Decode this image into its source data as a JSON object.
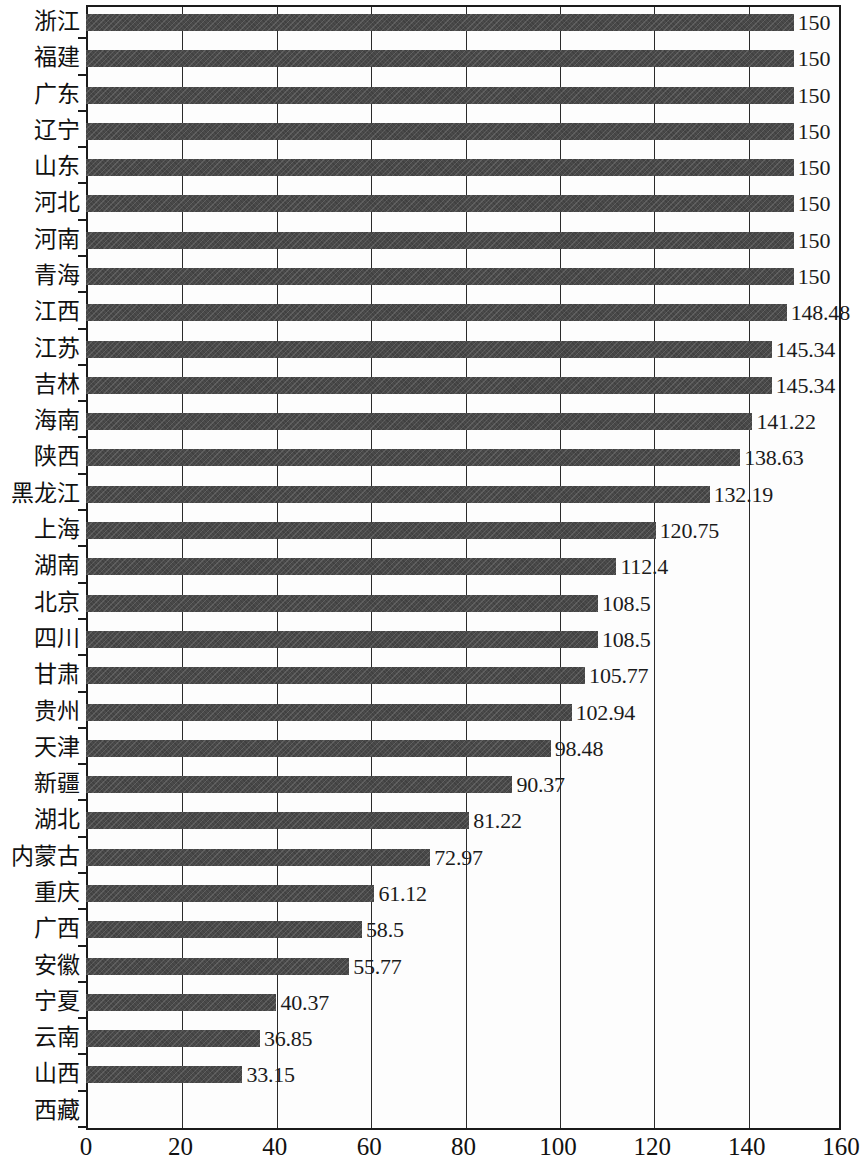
{
  "chart_data": {
    "type": "bar",
    "orientation": "horizontal",
    "title": "",
    "subtitle": "",
    "xlabel": "",
    "ylabel": "",
    "xlim": [
      0,
      160
    ],
    "xticks": [
      0,
      20,
      40,
      60,
      80,
      100,
      120,
      140,
      160
    ],
    "grid": "vertical",
    "legend": null,
    "bar_color": "#4a4a4a",
    "axis_color": "#1b1b1b",
    "background_color": "#fdfdfd",
    "categories": [
      "浙江",
      "福建",
      "广东",
      "辽宁",
      "山东",
      "河北",
      "河南",
      "青海",
      "江西",
      "江苏",
      "吉林",
      "海南",
      "陕西",
      "黑龙江",
      "上海",
      "湖南",
      "北京",
      "四川",
      "甘肃",
      "贵州",
      "天津",
      "新疆",
      "湖北",
      "内蒙古",
      "重庆",
      "广西",
      "安徽",
      "宁夏",
      "云南",
      "山西",
      "西藏"
    ],
    "values": [
      150,
      150,
      150,
      150,
      150,
      150,
      150,
      150,
      148.48,
      145.34,
      145.34,
      141.22,
      138.63,
      132.19,
      120.75,
      112.4,
      108.5,
      108.5,
      105.77,
      102.94,
      98.48,
      90.37,
      81.22,
      72.97,
      61.12,
      58.5,
      55.77,
      40.37,
      36.85,
      33.15,
      0
    ],
    "value_labels": [
      "150",
      "150",
      "150",
      "150",
      "150",
      "150",
      "150",
      "150",
      "148.48",
      "145.34",
      "145.34",
      "141.22",
      "138.63",
      "132.19",
      "120.75",
      "112.4",
      "108.5",
      "108.5",
      "105.77",
      "102.94",
      "98.48",
      "90.37",
      "81.22",
      "72.97",
      "61.12",
      "58.5",
      "55.77",
      "40.37",
      "36.85",
      "33.15",
      ""
    ]
  }
}
